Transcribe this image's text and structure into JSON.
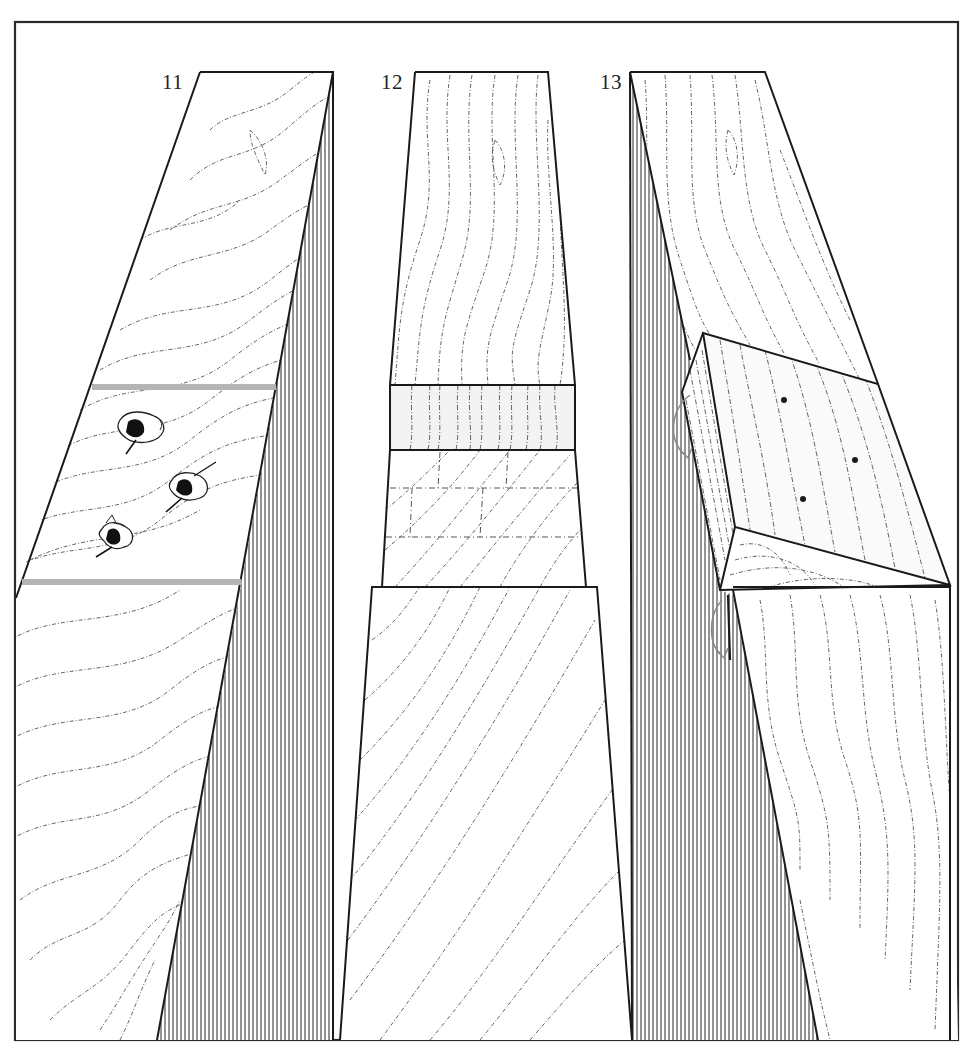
{
  "figure": {
    "frame": {
      "x": 15,
      "y": 22,
      "width": 943,
      "height": 1018,
      "stroke": "#2a2a2a"
    },
    "colors": {
      "ink": "#1a1a1a",
      "grain": "#555555",
      "hatch": "#3a3a3a",
      "marker_bar": "#b4b4b4",
      "background": "#ffffff",
      "light_band": "#f3f3f3"
    },
    "panels": [
      {
        "id": "11",
        "label": "11",
        "label_pos": {
          "x": 162,
          "y": 70
        },
        "description": "Board with three tear-out defects between two gray marker lines",
        "marker_bars": [
          {
            "x1": 92,
            "y1": 387,
            "x2": 276,
            "y2": 387
          },
          {
            "x1": 22,
            "y1": 582,
            "x2": 241,
            "y2": 582
          }
        ],
        "defects": [
          {
            "x": 140,
            "y": 430
          },
          {
            "x": 188,
            "y": 488
          },
          {
            "x": 116,
            "y": 537
          }
        ]
      },
      {
        "id": "12",
        "label": "12",
        "label_pos": {
          "x": 381,
          "y": 70
        },
        "description": "Tapered board with recessed patch area showing layout lines"
      },
      {
        "id": "13",
        "label": "13",
        "label_pos": {
          "x": 600,
          "y": 70
        },
        "description": "Board with tilted wedge-shaped patch block being fitted, with rotation arrows",
        "patch_dots": [
          {
            "x": 784,
            "y": 400
          },
          {
            "x": 855,
            "y": 460
          },
          {
            "x": 803,
            "y": 499
          }
        ]
      }
    ]
  }
}
